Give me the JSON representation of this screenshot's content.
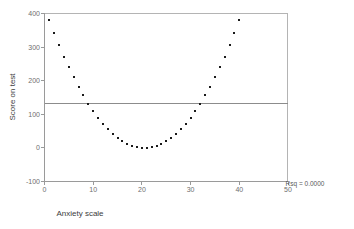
{
  "chart_data": {
    "type": "scatter",
    "title": "",
    "xlabel": "Anxiety scale",
    "ylabel": "Score on test",
    "xlim": [
      0,
      50
    ],
    "ylim": [
      -100,
      400
    ],
    "xticks": [
      0,
      10,
      20,
      30,
      40,
      50
    ],
    "xtick_labels": [
      "0",
      "10",
      "20",
      "30",
      "40",
      "50"
    ],
    "yticks": [
      -100,
      0,
      100,
      200,
      300,
      400
    ],
    "ytick_labels": [
      "-100",
      "0",
      "100",
      "200",
      "300",
      "400"
    ],
    "grid": false,
    "legend": null,
    "annotations": [
      {
        "name": "rsq-annotation",
        "text": "Rsq = 0.0000",
        "x": 52.5,
        "y": -95
      }
    ],
    "reference_lines": [
      {
        "name": "mean-reference-line",
        "orientation": "horizontal",
        "y": 133,
        "color": "#8c8c8c"
      }
    ],
    "marker": {
      "shape": "square",
      "size": 2,
      "color": "#1a1a1a"
    },
    "x": [
      1,
      2,
      3,
      4,
      5,
      6,
      7,
      8,
      9,
      10,
      11,
      12,
      13,
      14,
      15,
      16,
      17,
      18,
      19,
      20,
      21,
      22,
      23,
      24,
      25,
      26,
      27,
      28,
      29,
      30,
      31,
      32,
      33,
      34,
      35,
      36,
      37,
      38,
      39,
      40
    ],
    "y": [
      380,
      342,
      306,
      272,
      240,
      210,
      182,
      156,
      132,
      110,
      90,
      72,
      56,
      42,
      30,
      20,
      12,
      6,
      2,
      0,
      0,
      2,
      6,
      12,
      20,
      30,
      42,
      56,
      72,
      90,
      110,
      132,
      156,
      182,
      210,
      240,
      272,
      306,
      342,
      380
    ]
  },
  "axes": {
    "y_title": "Score on test",
    "x_title": "Anxiety scale"
  }
}
